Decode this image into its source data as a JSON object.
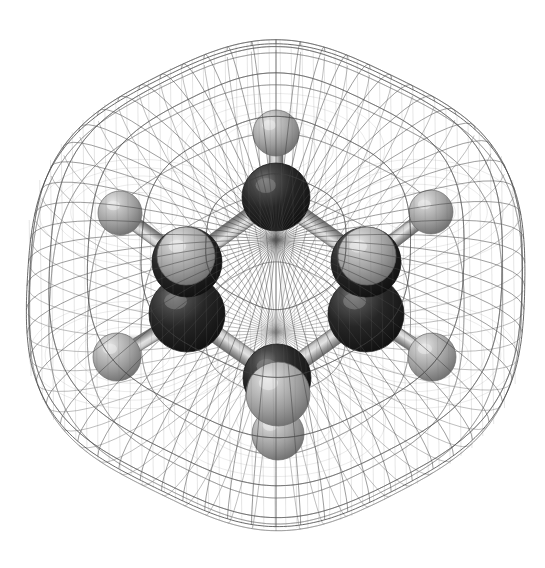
{
  "scene": {
    "title": "Benzene molecule 3D model",
    "subject": "benzene",
    "formula": "C6H6",
    "representation": "ball-and-stick with van der Waals wireframe surface",
    "background_color": "#ffffff",
    "width": 545,
    "height": 568
  },
  "palette": {
    "carbon_dark": "#1b1b1b",
    "carbon_mid": "#2e2e2e",
    "carbon_light": "#6a6a6a",
    "hydrogen_dark": "#6e6e6e",
    "hydrogen_mid": "#9a9a9a",
    "hydrogen_light": "#d6d6d6",
    "bond_dark": "#6b6b6b",
    "bond_light": "#cfcfcf",
    "mesh_line": "#4a4a4a",
    "mesh_line_faint": "#9b9b9b"
  },
  "atoms": [
    {
      "id": "C1",
      "element": "C",
      "label": "carbon",
      "cx": 276,
      "cy": 197,
      "r": 34,
      "z": 3,
      "color": "#1b1b1b"
    },
    {
      "id": "C2",
      "element": "C",
      "label": "carbon",
      "cx": 187,
      "cy": 262,
      "r": 35,
      "z": 2,
      "color": "#1b1b1b"
    },
    {
      "id": "C3",
      "element": "C",
      "label": "carbon",
      "cx": 187,
      "cy": 314,
      "r": 38,
      "z": 1,
      "color": "#1b1b1b"
    },
    {
      "id": "C4",
      "element": "C",
      "label": "carbon",
      "cx": 277,
      "cy": 378,
      "r": 34,
      "z": 3,
      "color": "#1b1b1b"
    },
    {
      "id": "C5",
      "element": "C",
      "label": "carbon",
      "cx": 366,
      "cy": 314,
      "r": 38,
      "z": 1,
      "color": "#1b1b1b"
    },
    {
      "id": "C6",
      "element": "C",
      "label": "carbon",
      "cx": 366,
      "cy": 262,
      "r": 35,
      "z": 2,
      "color": "#1b1b1b"
    },
    {
      "id": "H1",
      "element": "H",
      "label": "hydrogen",
      "cx": 276,
      "cy": 133,
      "r": 23,
      "z": 4,
      "color": "#9a9a9a"
    },
    {
      "id": "H2",
      "element": "H",
      "label": "hydrogen",
      "cx": 120,
      "cy": 213,
      "r": 22,
      "z": 4,
      "color": "#9a9a9a"
    },
    {
      "id": "H3",
      "element": "H",
      "label": "hydrogen",
      "cx": 117,
      "cy": 357,
      "r": 24,
      "z": 4,
      "color": "#9a9a9a"
    },
    {
      "id": "H4",
      "element": "H",
      "label": "hydrogen",
      "cx": 278,
      "cy": 434,
      "r": 26,
      "z": 4,
      "color": "#9a9a9a"
    },
    {
      "id": "H5",
      "element": "H",
      "label": "hydrogen",
      "cx": 432,
      "cy": 357,
      "r": 24,
      "z": 4,
      "color": "#9a9a9a"
    },
    {
      "id": "H6",
      "element": "H",
      "label": "hydrogen",
      "cx": 431,
      "cy": 212,
      "r": 22,
      "z": 4,
      "color": "#9a9a9a"
    },
    {
      "id": "H2b",
      "element": "H",
      "label": "hydrogen",
      "cx": 186,
      "cy": 256,
      "r": 29,
      "z": 5,
      "color": "#9fa0a0"
    },
    {
      "id": "H6b",
      "element": "H",
      "label": "hydrogen",
      "cx": 367,
      "cy": 256,
      "r": 29,
      "z": 5,
      "color": "#9fa0a0"
    },
    {
      "id": "H4b",
      "element": "H",
      "label": "hydrogen",
      "cx": 278,
      "cy": 394,
      "r": 32,
      "z": 6,
      "color": "#a8a8a8"
    }
  ],
  "bonds": [
    {
      "id": "C1-C2",
      "from": "C1",
      "to": "C2",
      "order": "aromatic",
      "width": 17
    },
    {
      "id": "C2-C3",
      "from": "C2",
      "to": "C3",
      "order": "aromatic",
      "width": 17
    },
    {
      "id": "C3-C4",
      "from": "C3",
      "to": "C4",
      "order": "aromatic",
      "width": 17
    },
    {
      "id": "C4-C5",
      "from": "C4",
      "to": "C5",
      "order": "aromatic",
      "width": 17
    },
    {
      "id": "C5-C6",
      "from": "C5",
      "to": "C6",
      "order": "aromatic",
      "width": 17
    },
    {
      "id": "C6-C1",
      "from": "C6",
      "to": "C1",
      "order": "aromatic",
      "width": 17
    },
    {
      "id": "C1-H1",
      "from": "C1",
      "to": "H1",
      "order": "single",
      "width": 14
    },
    {
      "id": "C2-H2",
      "from": "C2",
      "to": "H2",
      "order": "single",
      "width": 14
    },
    {
      "id": "C3-H3",
      "from": "C3",
      "to": "H3",
      "order": "single",
      "width": 14
    },
    {
      "id": "C4-H4",
      "from": "C4",
      "to": "H4",
      "order": "single",
      "width": 14
    },
    {
      "id": "C5-H5",
      "from": "C5",
      "to": "H5",
      "order": "single",
      "width": 14
    },
    {
      "id": "C6-H6",
      "from": "C6",
      "to": "H6",
      "order": "single",
      "width": 14
    }
  ],
  "surface": {
    "type": "van-der-waals-wireframe",
    "lobes": [
      {
        "cx": 276,
        "cy": 150,
        "r": 118
      },
      {
        "cx": 140,
        "cy": 212,
        "r": 110
      },
      {
        "cx": 132,
        "cy": 355,
        "r": 112
      },
      {
        "cx": 277,
        "cy": 420,
        "r": 118
      },
      {
        "cx": 414,
        "cy": 355,
        "r": 112
      },
      {
        "cx": 418,
        "cy": 212,
        "r": 110
      },
      {
        "cx": 276,
        "cy": 286,
        "r": 158
      }
    ],
    "center": {
      "x": 276,
      "y": 286
    },
    "outer_radius_x": 262,
    "outer_radius_y": 250,
    "line_count_u": 46,
    "line_count_v": 30
  }
}
